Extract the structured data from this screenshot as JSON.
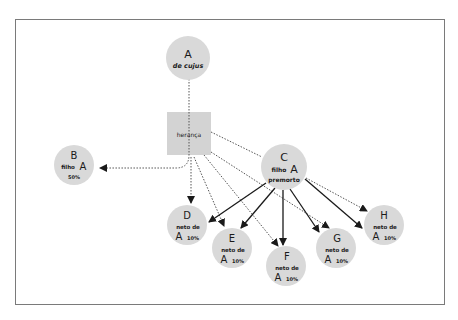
{
  "diagram": {
    "type": "inheritance-flow",
    "colors": {
      "node_fill": "#d9d9d9",
      "box_fill": "#d3d3d3",
      "frame": "#7a7a7a",
      "dotted_edge": "#555555",
      "solid_edge": "#1a1a1a",
      "text": "#1a1a1a"
    },
    "nodes": {
      "A": {
        "letter": "A",
        "sub": "de cujus"
      },
      "heranca": {
        "label": "herança"
      },
      "B": {
        "letter": "B",
        "role": "filho",
        "ref": "A",
        "share": "50%"
      },
      "C": {
        "letter": "C",
        "role": "filho",
        "ref": "A",
        "status": "premorto"
      },
      "D": {
        "letter": "D",
        "role": "neto de",
        "ref": "A",
        "share": "10%"
      },
      "E": {
        "letter": "E",
        "role": "neto de",
        "ref": "A",
        "share": "10%"
      },
      "F": {
        "letter": "F",
        "role": "neto de",
        "ref": "A",
        "share": "10%"
      },
      "G": {
        "letter": "G",
        "role": "neto de",
        "ref": "A",
        "share": "10%"
      },
      "H": {
        "letter": "H",
        "role": "neto de",
        "ref": "A",
        "share": "10%"
      }
    },
    "edges": [
      {
        "from": "A",
        "to": "heranca",
        "style": "dotted"
      },
      {
        "from": "heranca",
        "to": "B",
        "style": "dotted"
      },
      {
        "from": "heranca",
        "to": "C",
        "style": "dotted"
      },
      {
        "from": "heranca",
        "to": "D",
        "style": "dotted"
      },
      {
        "from": "heranca",
        "to": "E",
        "style": "dotted"
      },
      {
        "from": "heranca",
        "to": "F",
        "style": "dotted"
      },
      {
        "from": "heranca",
        "to": "G",
        "style": "dotted"
      },
      {
        "from": "C",
        "to": "H",
        "style": "dotted"
      },
      {
        "from": "C",
        "to": "D",
        "style": "solid"
      },
      {
        "from": "C",
        "to": "E",
        "style": "solid"
      },
      {
        "from": "C",
        "to": "F",
        "style": "solid"
      },
      {
        "from": "C",
        "to": "G",
        "style": "solid"
      },
      {
        "from": "C",
        "to": "H",
        "style": "solid"
      }
    ]
  }
}
